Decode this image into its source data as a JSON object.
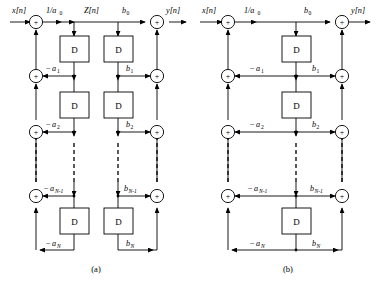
{
  "figure": {
    "panels": [
      {
        "id": "a",
        "caption": "(a)",
        "form": "direct-form-I",
        "input_label": "x[n]",
        "output_label": "y[n]",
        "intermediate_label": "Z[n]",
        "input_gain_label": "1/a",
        "input_gain_sub": "0",
        "delay_letter": "D",
        "delay_count_left": 3,
        "delay_count_right": 3,
        "feedback_coefficients": [
          {
            "sign": "−",
            "symbol": "a",
            "sub": "1",
            "text": "−a1"
          },
          {
            "sign": "−",
            "symbol": "a",
            "sub": "2",
            "text": "−a2"
          },
          {
            "sign": "−",
            "symbol": "a",
            "sub": "N-1",
            "text": "−aN-1"
          },
          {
            "sign": "−",
            "symbol": "a",
            "sub": "N",
            "text": "−aN"
          }
        ],
        "feedforward_coefficients": [
          {
            "sign": "",
            "symbol": "b",
            "sub": "0",
            "text": "b0"
          },
          {
            "sign": "",
            "symbol": "b",
            "sub": "1",
            "text": "b1"
          },
          {
            "sign": "",
            "symbol": "b",
            "sub": "2",
            "text": "b2"
          },
          {
            "sign": "",
            "symbol": "b",
            "sub": "N-1",
            "text": "bN-1"
          },
          {
            "sign": "",
            "symbol": "b",
            "sub": "N",
            "text": "bN"
          }
        ],
        "adder_symbol": "+",
        "adder_count_left": 4,
        "adder_count_right": 4,
        "ellipsis": "vertical dashed continuation"
      },
      {
        "id": "b",
        "caption": "(b)",
        "form": "direct-form-II",
        "input_label": "x[n]",
        "output_label": "y[n]",
        "intermediate_label": "",
        "input_gain_label": "1/a",
        "input_gain_sub": "0",
        "delay_letter": "D",
        "delay_count_center": 3,
        "feedback_coefficients": [
          {
            "sign": "−",
            "symbol": "a",
            "sub": "1",
            "text": "−a1"
          },
          {
            "sign": "−",
            "symbol": "a",
            "sub": "2",
            "text": "−a2"
          },
          {
            "sign": "−",
            "symbol": "a",
            "sub": "N-1",
            "text": "−aN-1"
          },
          {
            "sign": "−",
            "symbol": "a",
            "sub": "N",
            "text": "−aN"
          }
        ],
        "feedforward_coefficients": [
          {
            "sign": "",
            "symbol": "b",
            "sub": "0",
            "text": "b0"
          },
          {
            "sign": "",
            "symbol": "b",
            "sub": "1",
            "text": "b1"
          },
          {
            "sign": "",
            "symbol": "b",
            "sub": "2",
            "text": "b2"
          },
          {
            "sign": "",
            "symbol": "b",
            "sub": "N-1",
            "text": "bN-1"
          },
          {
            "sign": "",
            "symbol": "b",
            "sub": "N",
            "text": "bN"
          }
        ],
        "adder_symbol": "+",
        "adder_count_left": 4,
        "adder_count_right": 4,
        "ellipsis": "vertical dashed continuation"
      }
    ],
    "colors": {
      "line": "#000000",
      "background": "#ffffff",
      "text": "#000000"
    }
  }
}
